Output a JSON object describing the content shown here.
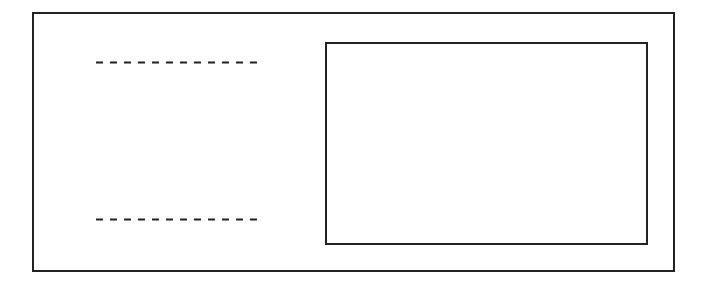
{
  "diagram": {
    "stroke_color": "#222222",
    "background_color": "#ffffff",
    "outer_frame": {
      "x": 32,
      "y": 12,
      "width": 641,
      "height": 258
    },
    "inner_box": {
      "x": 325,
      "y": 42,
      "width": 321,
      "height": 201
    },
    "dashed_lines": [
      {
        "x1": 96,
        "x2": 263,
        "y": 62
      },
      {
        "x1": 96,
        "x2": 263,
        "y": 219
      }
    ]
  }
}
